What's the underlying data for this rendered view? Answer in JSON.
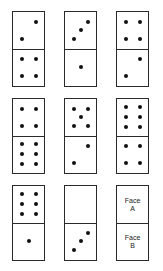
{
  "puzzle": {
    "dominoes": [
      {
        "top": 2,
        "bottom": 4
      },
      {
        "top": 3,
        "bottom": 1
      },
      {
        "top": 4,
        "bottom": 2
      },
      {
        "top": 4,
        "bottom": 6
      },
      {
        "top": 5,
        "bottom": 2
      },
      {
        "top": 6,
        "bottom": 4
      },
      {
        "top": 6,
        "bottom": 1
      },
      {
        "top": 0,
        "bottom": 3
      }
    ],
    "answer_domino": {
      "top_label_line1": "Face",
      "top_label_line2": "A",
      "bottom_label_line1": "Face",
      "bottom_label_line2": "B"
    }
  }
}
